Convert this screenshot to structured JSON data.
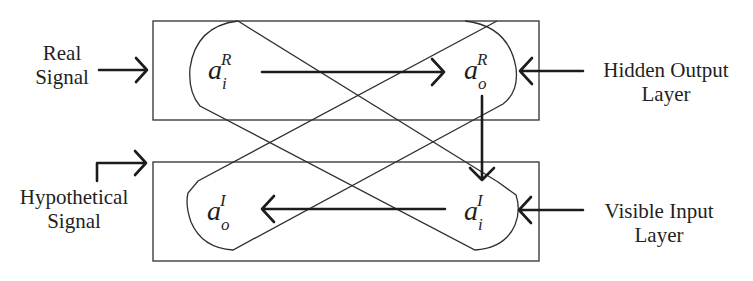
{
  "diagram": {
    "type": "signal-flow",
    "labels": {
      "real_signal": [
        "Real",
        "Signal"
      ],
      "hypothetical_signal": [
        "Hypothetical",
        "Signal"
      ],
      "hidden_output_layer": [
        "Hidden Output",
        "Layer"
      ],
      "visible_input_layer": [
        "Visible Input",
        "Layer"
      ]
    },
    "nodes": {
      "hidden_input_real": {
        "base": "a",
        "sup": "R",
        "sub": "i"
      },
      "hidden_output_real": {
        "base": "a",
        "sup": "R",
        "sub": "o"
      },
      "visible_output_hyp": {
        "base": "a",
        "sup": "I",
        "sub": "o"
      },
      "visible_input_hyp": {
        "base": "a",
        "sup": "I",
        "sub": "i"
      }
    },
    "boxes": [
      {
        "name": "upper-layer-box",
        "x": 153,
        "y": 21,
        "w": 386,
        "h": 99
      },
      {
        "name": "lower-layer-box",
        "x": 153,
        "y": 162,
        "w": 386,
        "h": 99
      }
    ],
    "edges": [
      {
        "from": "real_signal",
        "to": "upper-layer-box"
      },
      {
        "from": "hypothetical_signal",
        "to": "lower-layer-box"
      },
      {
        "from": "hidden_input_real",
        "to": "hidden_output_real"
      },
      {
        "from": "hidden_output_real",
        "to": "visible_input_hyp"
      },
      {
        "from": "visible_input_hyp",
        "to": "visible_output_hyp"
      },
      {
        "from": "hidden_output_layer",
        "to": "hidden_output_real"
      },
      {
        "from": "visible_input_layer",
        "to": "visible_input_hyp"
      }
    ],
    "colors": {
      "stroke": "#2a2a2a",
      "background": "#ffffff"
    }
  }
}
